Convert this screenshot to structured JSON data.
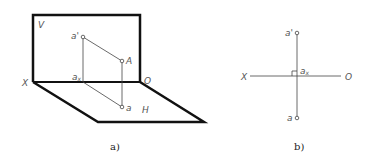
{
  "figure_a": {
    "caption": "a)",
    "labels": {
      "V": "V",
      "X": "X",
      "O": "O",
      "H": "H",
      "A": "A",
      "a_prime": "a'",
      "a_x": "a",
      "a_x_sub": "x",
      "a": "a"
    }
  },
  "figure_b": {
    "caption": "b)",
    "labels": {
      "X": "X",
      "O": "O",
      "a_prime": "a'",
      "a_x": "a",
      "a_x_sub": "x",
      "a": "a"
    }
  },
  "colors": {
    "thick_line": "#111111",
    "thin_line": "#444444",
    "label": "#555555"
  }
}
